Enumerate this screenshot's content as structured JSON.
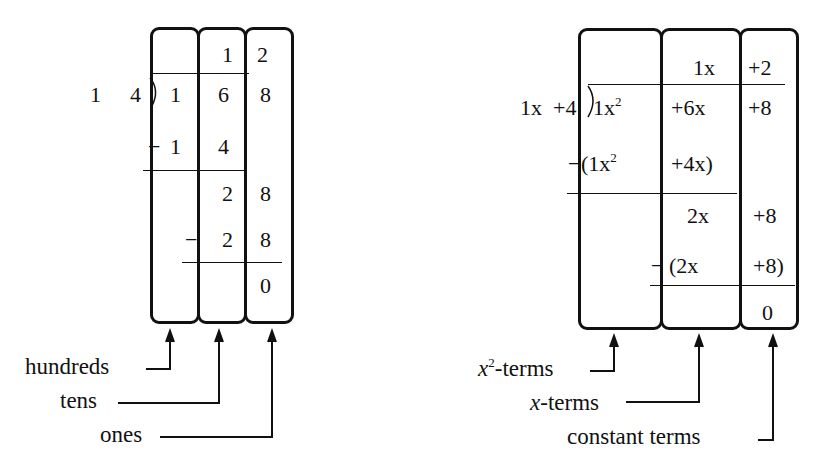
{
  "left_diagram": {
    "title": "long division of numbers",
    "divisor": [
      "1",
      "4"
    ],
    "quotient": {
      "tens": "1",
      "ones": "2"
    },
    "dividend": {
      "hundreds": "1",
      "tens": "6",
      "ones": "8"
    },
    "step1": {
      "minus": "−",
      "hundreds": "1",
      "tens": "4"
    },
    "remainder1": {
      "tens": "2",
      "ones": "8"
    },
    "step2": {
      "minus": "−",
      "tens": "2",
      "ones": "8"
    },
    "result": {
      "ones": "0"
    },
    "labels": {
      "hundreds": "hundreds",
      "tens": "tens",
      "ones": "ones"
    }
  },
  "right_diagram": {
    "title": "long division of polynomials",
    "divisor": {
      "term1": "1x",
      "term2": "+4"
    },
    "quotient": {
      "x_term": "1x",
      "const": "+2"
    },
    "dividend": {
      "x2_coef": "1x",
      "x2_exp": "2",
      "x_term": "+6x",
      "const": "+8"
    },
    "step1": {
      "minus": "−",
      "x2_part": "(1x",
      "x2_exp": "2",
      "x_part": "+4x)"
    },
    "remainder1": {
      "x_term": "2x",
      "const": "+8"
    },
    "step2": {
      "minus": "−",
      "x_part": "(2x",
      "const_part": "+8)"
    },
    "result": {
      "const": "0"
    },
    "labels": {
      "x2_base": "x",
      "x2_exp": "2",
      "x2_suffix": "-terms",
      "x_base": "x",
      "x_suffix": "-terms",
      "constant": "constant terms"
    }
  }
}
